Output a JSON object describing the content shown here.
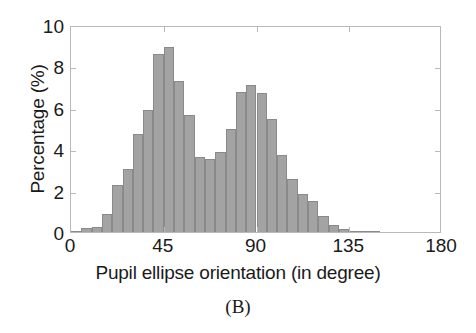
{
  "figure": {
    "caption": "(B)"
  },
  "chart_data": {
    "type": "bar",
    "title": "",
    "subtitle": "",
    "xlabel": "Pupil ellipse orientation (in degree)",
    "ylabel": "Percentage (%)",
    "xlim": [
      0,
      180
    ],
    "ylim": [
      0,
      10
    ],
    "xticks": [
      0,
      45,
      90,
      135,
      180
    ],
    "xtick_labels": [
      "0",
      "45",
      "90",
      "135",
      "180"
    ],
    "yticks": [
      0,
      2,
      4,
      6,
      8,
      10
    ],
    "ytick_labels": [
      "0",
      "2",
      "4",
      "6",
      "8",
      "10"
    ],
    "grid": false,
    "legend": null,
    "bin_width": 5,
    "bar_color": "#a3a3a3",
    "bar_edge_color": "#8a8a8a",
    "categories": [
      "0-5",
      "5-10",
      "10-15",
      "15-20",
      "20-25",
      "25-30",
      "30-35",
      "35-40",
      "40-45",
      "45-50",
      "50-55",
      "55-60",
      "60-65",
      "65-70",
      "70-75",
      "75-80",
      "80-85",
      "85-90",
      "90-95",
      "95-100",
      "100-105",
      "105-110",
      "110-115",
      "115-120",
      "120-125",
      "125-130",
      "130-135",
      "135-140",
      "140-145",
      "145-150",
      "150-155",
      "155-160",
      "160-165",
      "165-170",
      "170-175",
      "175-180"
    ],
    "bin_centers": [
      2.5,
      7.5,
      12.5,
      17.5,
      22.5,
      27.5,
      32.5,
      37.5,
      42.5,
      47.5,
      52.5,
      57.5,
      62.5,
      67.5,
      72.5,
      77.5,
      82.5,
      87.5,
      92.5,
      97.5,
      102.5,
      107.5,
      112.5,
      117.5,
      122.5,
      127.5,
      132.5,
      137.5,
      142.5,
      147.5,
      152.5,
      157.5,
      162.5,
      167.5,
      172.5,
      177.5
    ],
    "values": [
      0.05,
      0.2,
      0.25,
      0.85,
      2.25,
      3.05,
      4.75,
      5.9,
      8.6,
      8.95,
      7.3,
      5.65,
      3.6,
      3.55,
      3.85,
      5.0,
      6.75,
      7.1,
      6.7,
      5.45,
      3.7,
      2.55,
      1.85,
      1.5,
      0.75,
      0.35,
      0.15,
      0.05,
      0.03,
      0.02,
      0.0,
      0.0,
      0.0,
      0.0,
      0.0,
      0.0
    ],
    "peaks": [
      {
        "center": 47.5,
        "value": 8.95
      },
      {
        "center": 87.5,
        "value": 7.1
      }
    ]
  }
}
